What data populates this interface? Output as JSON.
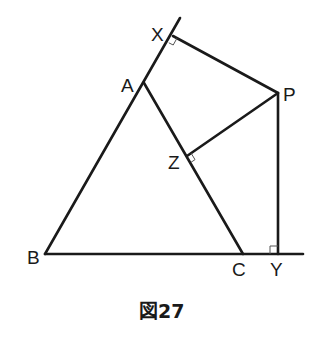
{
  "diagram": {
    "caption": "図27",
    "points": {
      "A": {
        "label": "A",
        "x": 144,
        "y": 83
      },
      "B": {
        "label": "B",
        "x": 45,
        "y": 254
      },
      "C": {
        "label": "C",
        "x": 243,
        "y": 254
      },
      "X": {
        "label": "X",
        "x": 173,
        "y": 36
      },
      "P": {
        "label": "P",
        "x": 278,
        "y": 93
      },
      "Z": {
        "label": "Z",
        "x": 187,
        "y": 156
      },
      "Y": {
        "label": "Y",
        "x": 278,
        "y": 254
      }
    },
    "segments": [
      {
        "from": "B",
        "to": "X-ext",
        "desc": "line BA extended past A through X"
      },
      {
        "from": "A",
        "to": "C"
      },
      {
        "from": "B",
        "to": "Y-ext",
        "desc": "line BC extended past C through Y"
      },
      {
        "from": "X",
        "to": "P"
      },
      {
        "from": "Z",
        "to": "P"
      },
      {
        "from": "P",
        "to": "Y"
      }
    ],
    "right_angles": [
      "X",
      "Z",
      "Y"
    ],
    "stroke_color": "#1a1a1a"
  }
}
